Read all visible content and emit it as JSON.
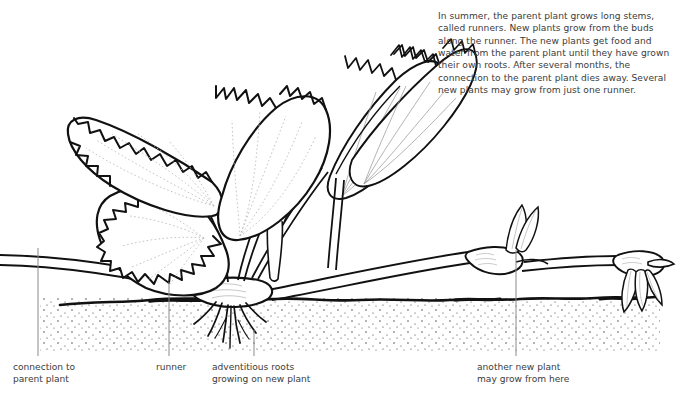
{
  "figure": {
    "background_color": "#ffffff",
    "ink_color": "#111111",
    "text_color": "#3b3b3b",
    "leader_color": "#8a8a8a"
  },
  "note": {
    "text": "In summer, the parent plant grows long stems, called runners. New plants grow from the buds along the runner. The new plants get food and water from the parent plant until they have grown their own roots. After several months, the connection to the parent plant dies away. Several new plants may grow from just one runner."
  },
  "labels": {
    "connection": "connection to\nparent plant",
    "runner": "runner",
    "adventitious": "adventitious roots\ngrowing on new plant",
    "another": "another new plant\nmay grow from here"
  },
  "leaders": [
    {
      "name": "connection",
      "x": 38,
      "y_top": 248,
      "y_bottom": 356
    },
    {
      "name": "runner",
      "x": 169,
      "y_top": 282,
      "y_bottom": 356
    },
    {
      "name": "adventitious",
      "x": 254,
      "y_top": 330,
      "y_bottom": 356
    },
    {
      "name": "another",
      "x": 516,
      "y_top": 250,
      "y_bottom": 356
    }
  ]
}
